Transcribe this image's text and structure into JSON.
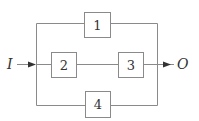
{
  "diagram": {
    "type": "block-diagram",
    "input_label": "I",
    "output_label": "O",
    "blocks": [
      {
        "id": "1",
        "label": "1"
      },
      {
        "id": "2",
        "label": "2"
      },
      {
        "id": "3",
        "label": "3"
      },
      {
        "id": "4",
        "label": "4"
      }
    ],
    "paths": [
      [
        "I",
        "1",
        "O"
      ],
      [
        "I",
        "2",
        "3",
        "O"
      ],
      [
        "I",
        "4",
        "O"
      ]
    ],
    "colors": {
      "line": "#8a8a8a",
      "text": "#333333",
      "background": "#ffffff"
    }
  }
}
